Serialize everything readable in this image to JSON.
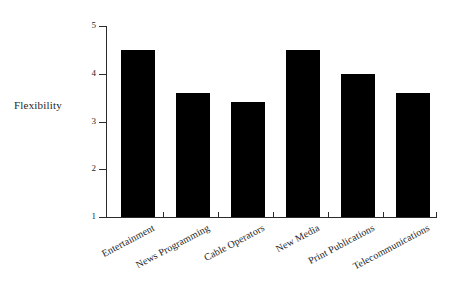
{
  "chart_data": {
    "type": "bar",
    "title": "",
    "subtitle": "",
    "xlabel": "",
    "ylabel": "Flexibility",
    "ylim": [
      1,
      5
    ],
    "yticks": [
      1,
      2,
      3,
      4,
      5
    ],
    "ytick_labels": [
      "1",
      "2",
      "3",
      "4",
      "5"
    ],
    "grid": false,
    "legend": false,
    "legend_position": "none",
    "bar_color": "#000000",
    "categories": [
      "Entertainment",
      "News Programming",
      "Cable Operators",
      "New Media",
      "Print Publications",
      "Telecommunications"
    ],
    "values": [
      4.5,
      3.6,
      3.4,
      4.5,
      4.0,
      3.6
    ]
  },
  "axis": {
    "y_title": "Flexibility",
    "tick_1": "1",
    "tick_2": "2",
    "tick_3": "3",
    "tick_4": "4",
    "tick_5": "5"
  },
  "categories": {
    "c0": "Entertainment",
    "c1": "News Programming",
    "c2": "Cable Operators",
    "c3": "New Media",
    "c4": "Print Publications",
    "c5": "Telecommunications"
  }
}
